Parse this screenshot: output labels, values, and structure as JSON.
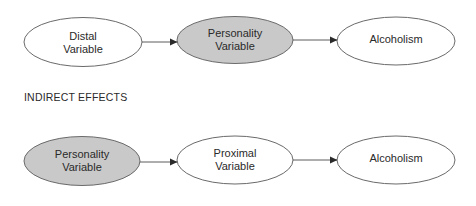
{
  "colors": {
    "shaded_fill": "#c9c9c9",
    "plain_fill": "#ffffff",
    "stroke": "#6a6a6a",
    "text": "#2a2a2a"
  },
  "sections": [
    {
      "label": "",
      "nodes": [
        {
          "id": "distal",
          "label": "Distal\nVariable",
          "shaded": false
        },
        {
          "id": "personality",
          "label": "Personality\nVariable",
          "shaded": true
        },
        {
          "id": "alcoholism",
          "label": "Alcoholism",
          "shaded": false
        }
      ],
      "edges": [
        {
          "from": "distal",
          "to": "personality"
        },
        {
          "from": "personality",
          "to": "alcoholism"
        }
      ]
    },
    {
      "label": "INDIRECT EFFECTS",
      "nodes": [
        {
          "id": "personality",
          "label": "Personality\nVariable",
          "shaded": true
        },
        {
          "id": "proximal",
          "label": "Proximal\nVariable",
          "shaded": false
        },
        {
          "id": "alcoholism",
          "label": "Alcoholism",
          "shaded": false
        }
      ],
      "edges": [
        {
          "from": "personality",
          "to": "proximal"
        },
        {
          "from": "proximal",
          "to": "alcoholism"
        }
      ]
    }
  ]
}
